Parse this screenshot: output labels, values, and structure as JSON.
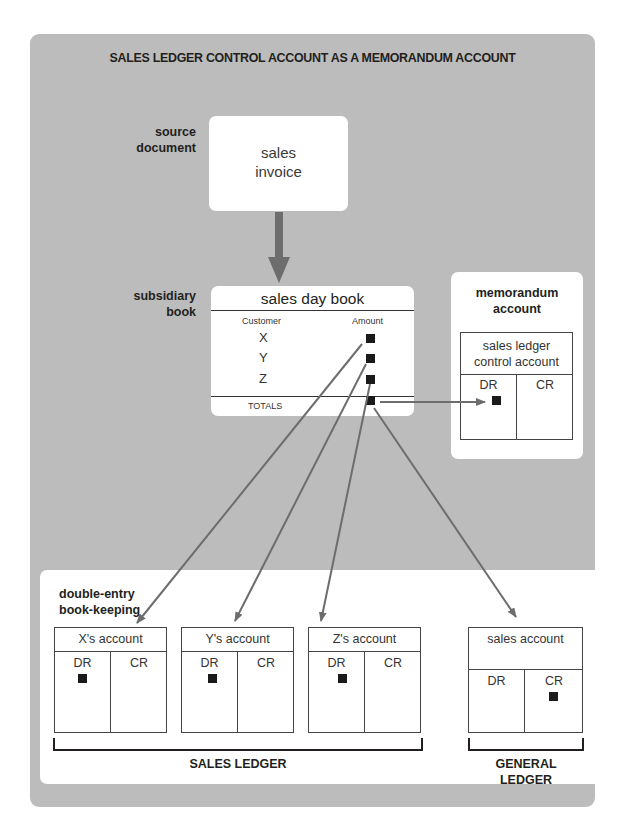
{
  "title": "SALES LEDGER CONTROL ACCOUNT AS A MEMORANDUM ACCOUNT",
  "labels": {
    "source_document": [
      "source",
      "document"
    ],
    "subsidiary_book": [
      "subsidiary",
      "book"
    ],
    "memorandum_account": [
      "memorandum",
      "account"
    ],
    "double_entry": [
      "double-entry",
      "book-keeping"
    ]
  },
  "invoice": {
    "lines": [
      "sales",
      "invoice"
    ]
  },
  "day_book": {
    "title": "sales day book",
    "col_customer": "Customer",
    "col_amount": "Amount",
    "rows": [
      "X",
      "Y",
      "Z"
    ],
    "totals": "TOTALS"
  },
  "control_account": {
    "title": [
      "sales ledger",
      "control account"
    ],
    "dr": "DR",
    "cr": "CR"
  },
  "accounts": [
    {
      "title": "X's account",
      "dr": "DR",
      "cr": "CR",
      "entry": "DR"
    },
    {
      "title": "Y's account",
      "dr": "DR",
      "cr": "CR",
      "entry": "DR"
    },
    {
      "title": "Z's account",
      "dr": "DR",
      "cr": "CR",
      "entry": "DR"
    },
    {
      "title": "sales account",
      "dr": "DR",
      "cr": "CR",
      "entry": "CR"
    }
  ],
  "ledgers": {
    "sales": "SALES LEDGER",
    "general": [
      "GENERAL",
      "LEDGER"
    ]
  },
  "colors": {
    "panel": "#bcbcbc",
    "arrow": "#6d6d6d",
    "text": "#231f20"
  }
}
